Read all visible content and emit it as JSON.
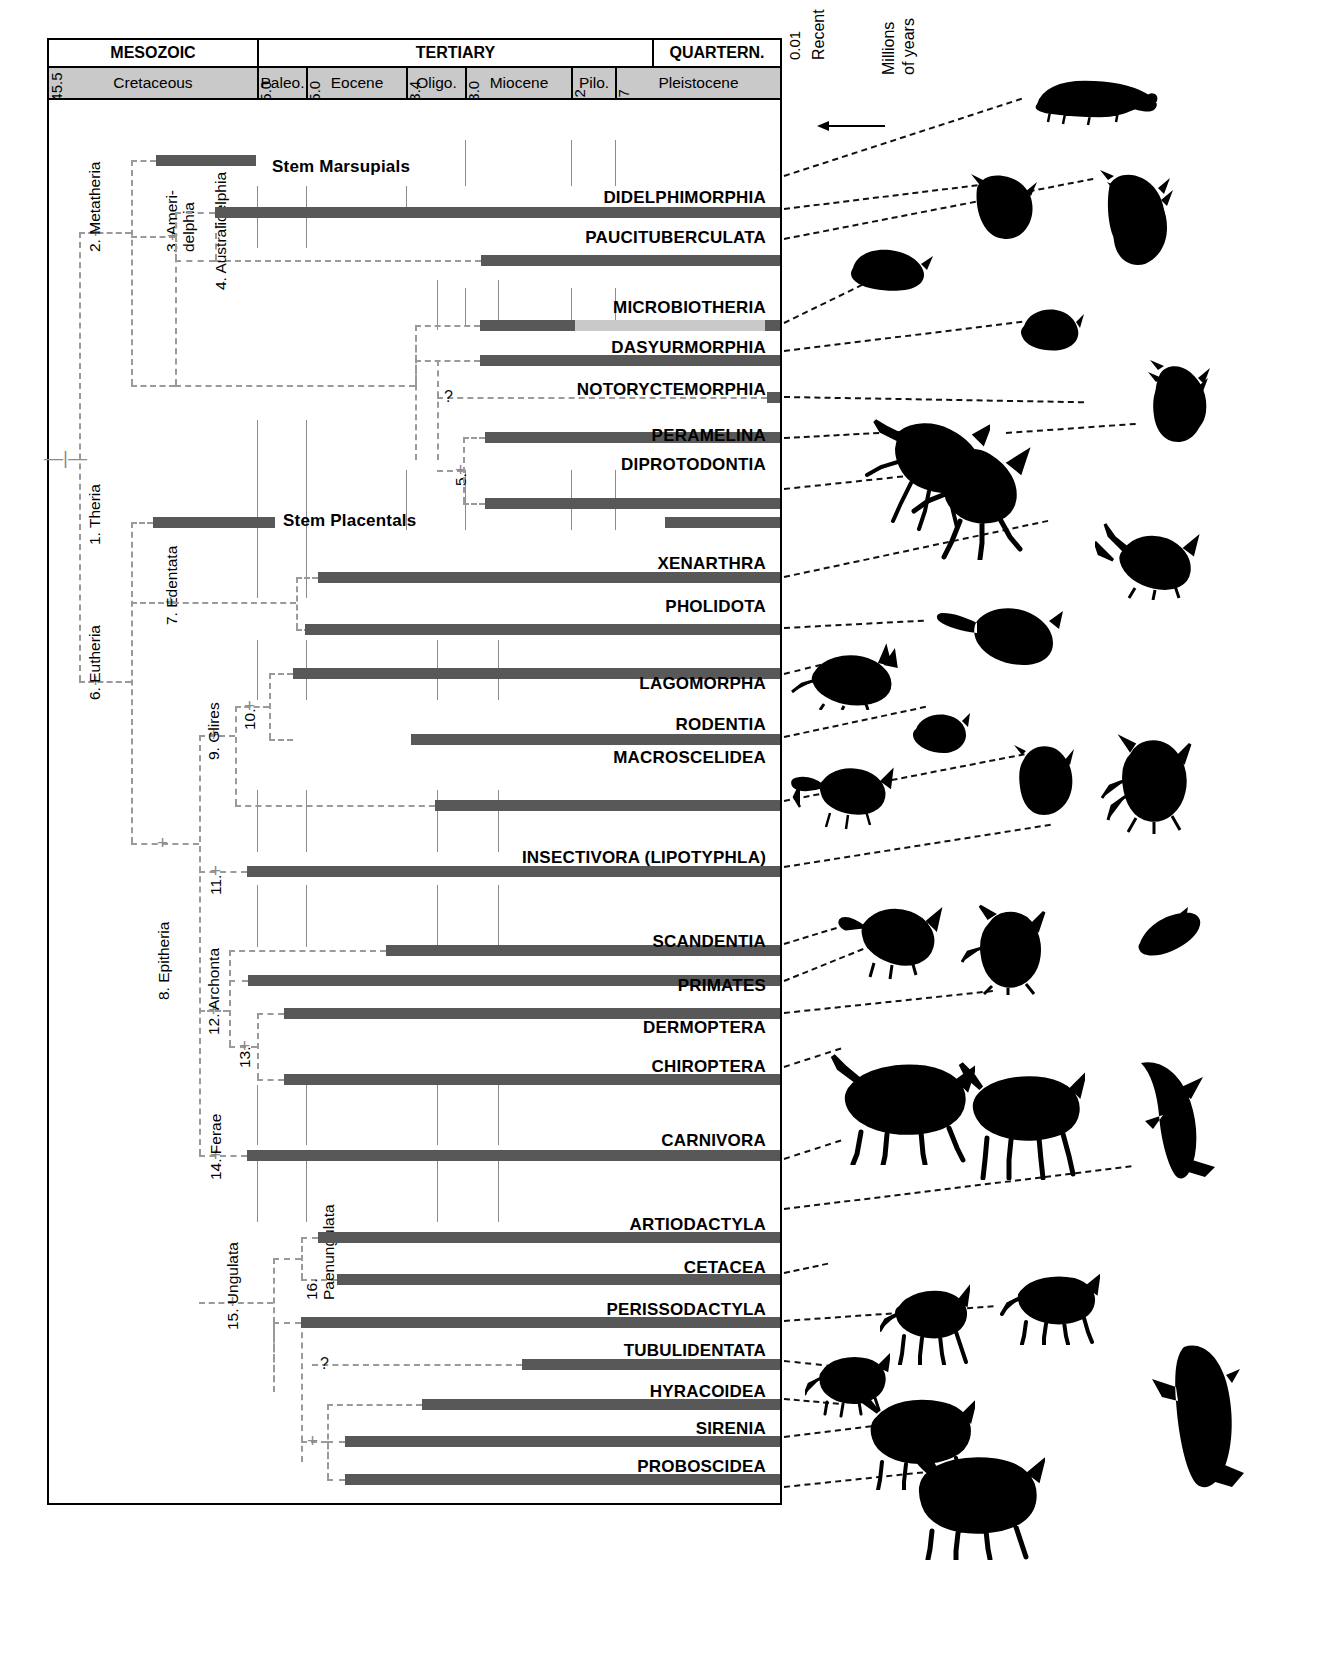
{
  "timescale": {
    "eras": [
      {
        "label": "MESOZOIC",
        "start_ma": 145.5,
        "end_ma": 65.0
      },
      {
        "label": "TERTIARY",
        "start_ma": 65.0,
        "end_ma": 1.7
      },
      {
        "label": "QUARTERN.",
        "start_ma": 1.7,
        "end_ma": 0.0
      }
    ],
    "periods": [
      {
        "label": "Cretaceous",
        "start_ma": 145.5,
        "end_ma": 65.0
      },
      {
        "label": "Paleo.",
        "start_ma": 65.0,
        "end_ma": 55.0
      },
      {
        "label": "Eocene",
        "start_ma": 55.0,
        "end_ma": 33.4
      },
      {
        "label": "Oligo.",
        "start_ma": 33.4,
        "end_ma": 23.0
      },
      {
        "label": "Miocene",
        "start_ma": 23.0,
        "end_ma": 5.2
      },
      {
        "label": "Pilo.",
        "start_ma": 5.2,
        "end_ma": 1.7
      },
      {
        "label": "Pleistocene",
        "start_ma": 1.7,
        "end_ma": 0.01
      }
    ],
    "tick_labels": [
      "145.5",
      "65.0",
      "55.0",
      "33.4",
      "23.0",
      "5.2",
      "1.7",
      "0.01"
    ],
    "recent_label": "Recent",
    "axis_label_line1": "Millions",
    "axis_label_line2": "of years",
    "axis_direction": "arrow-left"
  },
  "nodes": [
    {
      "id": 1,
      "label": "1. Theria"
    },
    {
      "id": 2,
      "label": "2. Metatheria"
    },
    {
      "id": 3,
      "label": "3. Ameri-\ndelphia",
      "line1": "3. Ameri-",
      "line2": "delphia"
    },
    {
      "id": 4,
      "label": "4. Australidelphia"
    },
    {
      "id": 5,
      "label": "5."
    },
    {
      "id": 6,
      "label": "6. Eutheria"
    },
    {
      "id": 7,
      "label": "7. Edentata"
    },
    {
      "id": 8,
      "label": "8. Epitheria"
    },
    {
      "id": 9,
      "label": "9. Glires"
    },
    {
      "id": 10,
      "label": "10."
    },
    {
      "id": 11,
      "label": "11."
    },
    {
      "id": 12,
      "label": "12. Archonta"
    },
    {
      "id": 13,
      "label": "13."
    },
    {
      "id": 14,
      "label": "14. Ferae"
    },
    {
      "id": 15,
      "label": "15. Ungulata"
    },
    {
      "id": 16,
      "label": "16.\nPaenungulata",
      "line1": "16.",
      "line2": "Paenungulata"
    }
  ],
  "taxa": [
    {
      "name": "Stem Marsupials",
      "inline_label": true,
      "bar_start_ma": 102.0,
      "bar_end_ma": 65.0,
      "segments": "single"
    },
    {
      "name": "DIDELPHIMORPHIA",
      "inline_label": false,
      "bar_start_ma": 118.0,
      "bar_end_ma": 0.0,
      "segments": "single"
    },
    {
      "name": "PAUCITUBERCULATA",
      "inline_label": false,
      "bar_start_ma": 24.0,
      "bar_end_ma": 0.0,
      "segments": "single"
    },
    {
      "name": "MICROBIOTHERIA",
      "inline_label": false,
      "bar_start_ma": 23.5,
      "bar_end_ma": 0.0,
      "segments": "dark-then-light",
      "dark_end_ma": 13.0,
      "tip_dark": true
    },
    {
      "name": "DASYURMORPHIA",
      "inline_label": false,
      "bar_start_ma": 24.0,
      "bar_end_ma": 0.0,
      "segments": "single"
    },
    {
      "name": "NOTORYCTEMORPHIA",
      "inline_label": false,
      "bar_start_ma": 2.3,
      "bar_end_ma": 0.0,
      "segments": "single"
    },
    {
      "name": "PERAMELINA",
      "inline_label": false,
      "bar_start_ma": 24.5,
      "bar_end_ma": 0.0,
      "segments": "single"
    },
    {
      "name": "DIPROTODONTIA",
      "inline_label": false,
      "bar_start_ma": 24.5,
      "bar_end_ma": 0.0,
      "segments": "single"
    },
    {
      "name": "Stem Placentals",
      "inline_label": true,
      "bar_start_ma": 103.0,
      "bar_end_ma": 62.0,
      "segments": "plus-late",
      "late_start_ma": 2.0,
      "late_end_ma": 0.0
    },
    {
      "name": "XENARTHRA",
      "inline_label": false,
      "bar_start_ma": 58.0,
      "bar_end_ma": 0.0,
      "segments": "single"
    },
    {
      "name": "PHOLIDOTA",
      "inline_label": false,
      "bar_start_ma": 59.5,
      "bar_end_ma": 0.0,
      "segments": "single"
    },
    {
      "name": "LAGOMORPHA",
      "inline_label": false,
      "bar_start_ma": 37.0,
      "bar_end_ma": 0.0,
      "segments": "single"
    },
    {
      "name": "RODENTIA",
      "inline_label": false,
      "bar_start_ma": 58.5,
      "bar_end_ma": 0.0,
      "segments": "single"
    },
    {
      "name": "MACROSCELIDEA",
      "inline_label": false,
      "bar_start_ma": 33.5,
      "bar_end_ma": 0.0,
      "segments": "single"
    },
    {
      "name": "INSECTIVORA (LIPOTYPHLA)",
      "inline_label": false,
      "bar_start_ma": 64.0,
      "bar_end_ma": 0.0,
      "segments": "single"
    },
    {
      "name": "SCANDENTIA",
      "inline_label": false,
      "bar_start_ma": 7.5,
      "bar_end_ma": 0.0,
      "segments": "single"
    },
    {
      "name": "PRIMATES",
      "inline_label": false,
      "bar_start_ma": 64.0,
      "bar_end_ma": 0.0,
      "segments": "single"
    },
    {
      "name": "DERMOPTERA",
      "inline_label": false,
      "bar_start_ma": 55.5,
      "bar_end_ma": 0.0,
      "segments": "single"
    },
    {
      "name": "CHIROPTERA",
      "inline_label": false,
      "bar_start_ma": 53.5,
      "bar_end_ma": 0.0,
      "segments": "single"
    },
    {
      "name": "CARNIVORA",
      "inline_label": false,
      "bar_start_ma": 64.0,
      "bar_end_ma": 0.0,
      "segments": "single"
    },
    {
      "name": "ARTIODACTYLA",
      "inline_label": false,
      "bar_start_ma": 57.5,
      "bar_end_ma": 0.0,
      "segments": "single"
    },
    {
      "name": "CETACEA",
      "inline_label": false,
      "bar_start_ma": 55.0,
      "bar_end_ma": 0.0,
      "segments": "single"
    },
    {
      "name": "PERISSODACTYLA",
      "inline_label": false,
      "bar_start_ma": 59.0,
      "bar_end_ma": 0.0,
      "segments": "single"
    },
    {
      "name": "TUBULIDENTATA",
      "inline_label": false,
      "bar_start_ma": 23.0,
      "bar_end_ma": 0.0,
      "segments": "single"
    },
    {
      "name": "HYRACOIDEA",
      "inline_label": false,
      "bar_start_ma": 50.0,
      "bar_end_ma": 0.0,
      "segments": "single"
    },
    {
      "name": "SIRENIA",
      "inline_label": false,
      "bar_start_ma": 56.0,
      "bar_end_ma": 0.0,
      "segments": "single"
    },
    {
      "name": "PROBOSCIDEA",
      "inline_label": false,
      "bar_start_ma": 56.0,
      "bar_end_ma": 0.0,
      "segments": "single"
    }
  ],
  "uncertain_markers": [
    "?",
    "?"
  ],
  "colors": {
    "bar_dark": "#585858",
    "bar_light": "#c9c9c9",
    "header_band": "#c9c9c9",
    "branch_dashed": "#9a9a9a",
    "frame": "#000000",
    "silhouette": "#000000"
  }
}
